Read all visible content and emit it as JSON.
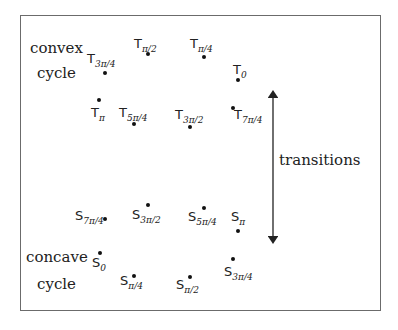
{
  "labels": {
    "convex": "convex",
    "convex_cycle": "cycle",
    "concave": "concave",
    "concave_cycle": "cycle",
    "transitions": "transitions"
  },
  "convex_points": [
    {
      "base": "T",
      "sub": "π/2",
      "lx": 134,
      "ly": 37,
      "dx": 148,
      "dy": 54
    },
    {
      "base": "T",
      "sub": "π/4",
      "lx": 190,
      "ly": 37,
      "dx": 204,
      "dy": 57
    },
    {
      "base": "T",
      "sub": "3π/4",
      "lx": 87,
      "ly": 52,
      "dx": 105,
      "dy": 73
    },
    {
      "base": "T",
      "sub": "0",
      "lx": 233,
      "ly": 63,
      "dx": 238,
      "dy": 80
    },
    {
      "base": "T",
      "sub": "π",
      "lx": 91,
      "ly": 106,
      "dx": 99,
      "dy": 100
    },
    {
      "base": "T",
      "sub": "5π/4",
      "lx": 119,
      "ly": 106,
      "dx": 134,
      "dy": 124
    },
    {
      "base": "T",
      "sub": "3π/2",
      "lx": 175,
      "ly": 108,
      "dx": 190,
      "dy": 127
    },
    {
      "base": "T",
      "sub": "7π/4",
      "lx": 234,
      "ly": 108,
      "dx": 233,
      "dy": 108
    }
  ],
  "concave_points": [
    {
      "base": "S",
      "sub": "7π/4",
      "lx": 75,
      "ly": 209,
      "dx": 105,
      "dy": 219
    },
    {
      "base": "S",
      "sub": "3π/2",
      "lx": 132,
      "ly": 208,
      "dx": 148,
      "dy": 205
    },
    {
      "base": "S",
      "sub": "5π/4",
      "lx": 188,
      "ly": 210,
      "dx": 204,
      "dy": 208
    },
    {
      "base": "S",
      "sub": "π",
      "lx": 231,
      "ly": 210,
      "dx": 238,
      "dy": 231
    },
    {
      "base": "S",
      "sub": "0",
      "lx": 92,
      "ly": 256,
      "dx": 100,
      "dy": 253
    },
    {
      "base": "S",
      "sub": "π/4",
      "lx": 120,
      "ly": 274,
      "dx": 134,
      "dy": 276
    },
    {
      "base": "S",
      "sub": "π/2",
      "lx": 176,
      "ly": 278,
      "dx": 190,
      "dy": 277
    },
    {
      "base": "S",
      "sub": "3π/4",
      "lx": 224,
      "ly": 265,
      "dx": 233,
      "dy": 259
    }
  ],
  "arrow": {
    "x": 273,
    "y1": 91,
    "y2": 242
  }
}
